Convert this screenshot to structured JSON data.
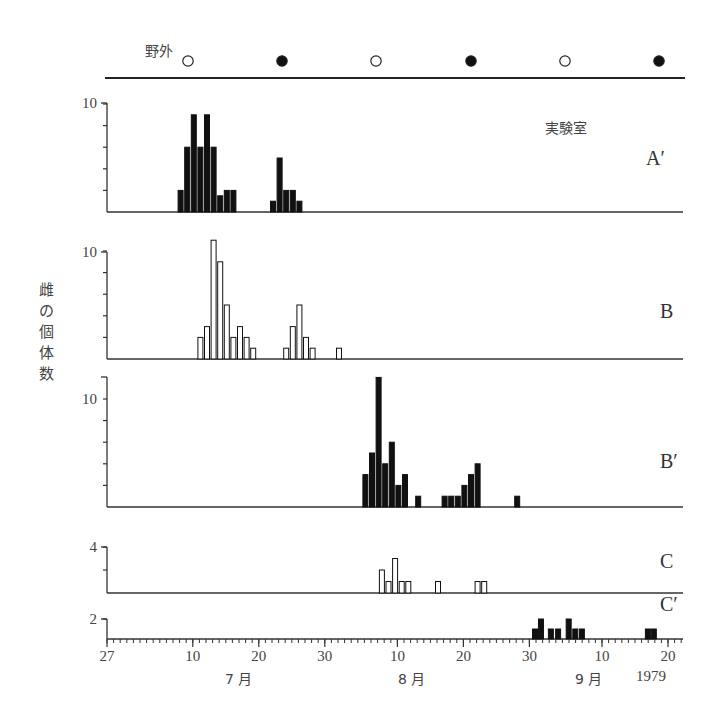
{
  "chart_data": [
    {
      "type": "bar",
      "panel": "A′",
      "fill": "#111111",
      "y_ticks": [
        2,
        4,
        6,
        8,
        10
      ],
      "y_label_shown": "10",
      "ylim": [
        0,
        10
      ],
      "bars": [
        {
          "day": 11,
          "value": 2
        },
        {
          "day": 12,
          "value": 6
        },
        {
          "day": 13,
          "value": 9
        },
        {
          "day": 14,
          "value": 6
        },
        {
          "day": 15,
          "value": 9
        },
        {
          "day": 16,
          "value": 6
        },
        {
          "day": 17,
          "value": 1.5
        },
        {
          "day": 18,
          "value": 2
        },
        {
          "day": 19,
          "value": 2
        },
        {
          "day": 25,
          "value": 1
        },
        {
          "day": 26,
          "value": 5
        },
        {
          "day": 27,
          "value": 2
        },
        {
          "day": 28,
          "value": 2
        },
        {
          "day": 29,
          "value": 1
        }
      ]
    },
    {
      "type": "bar",
      "panel": "B",
      "fill": "#ffffff",
      "y_ticks": [
        2,
        4,
        6,
        8,
        10
      ],
      "y_label_shown": "10",
      "ylim": [
        0,
        10
      ],
      "bars": [
        {
          "day": 14,
          "value": 2
        },
        {
          "day": 15,
          "value": 3
        },
        {
          "day": 16,
          "value": 11
        },
        {
          "day": 17,
          "value": 9
        },
        {
          "day": 18,
          "value": 5
        },
        {
          "day": 19,
          "value": 2
        },
        {
          "day": 20,
          "value": 3
        },
        {
          "day": 21,
          "value": 2
        },
        {
          "day": 22,
          "value": 1
        },
        {
          "day": 27,
          "value": 1
        },
        {
          "day": 28,
          "value": 3
        },
        {
          "day": 29,
          "value": 5
        },
        {
          "day": 30,
          "value": 2
        },
        {
          "day": 31,
          "value": 1
        },
        {
          "day": 35,
          "value": 1
        }
      ]
    },
    {
      "type": "bar",
      "panel": "B′",
      "fill": "#111111",
      "y_ticks": [
        2,
        4,
        6,
        8,
        10
      ],
      "y_label_shown": "10",
      "ylim": [
        0,
        12.5
      ],
      "bars": [
        {
          "day": 39,
          "value": 3
        },
        {
          "day": 40,
          "value": 5
        },
        {
          "day": 41,
          "value": 12
        },
        {
          "day": 42,
          "value": 4
        },
        {
          "day": 43,
          "value": 6
        },
        {
          "day": 44,
          "value": 2
        },
        {
          "day": 45,
          "value": 3
        },
        {
          "day": 47,
          "value": 1
        },
        {
          "day": 51,
          "value": 1
        },
        {
          "day": 52,
          "value": 1
        },
        {
          "day": 53,
          "value": 1
        },
        {
          "day": 54,
          "value": 2
        },
        {
          "day": 55,
          "value": 3
        },
        {
          "day": 56,
          "value": 4
        },
        {
          "day": 62,
          "value": 1
        }
      ]
    },
    {
      "type": "bar",
      "panel": "C",
      "fill": "#ffffff",
      "y_ticks": [
        2,
        4
      ],
      "y_label_shown": "4",
      "ylim": [
        0,
        4
      ],
      "bars": [
        {
          "day": 41.5,
          "value": 2
        },
        {
          "day": 42.5,
          "value": 1
        },
        {
          "day": 43.5,
          "value": 3
        },
        {
          "day": 44.5,
          "value": 1
        },
        {
          "day": 45.5,
          "value": 1
        },
        {
          "day": 50,
          "value": 1
        },
        {
          "day": 56,
          "value": 1
        },
        {
          "day": 57,
          "value": 1
        }
      ]
    },
    {
      "type": "bar",
      "panel": "C′",
      "fill": "#111111",
      "y_ticks": [
        2
      ],
      "y_label_shown": "2",
      "ylim": [
        0,
        2
      ],
      "bars": [
        {
          "day": 64.7,
          "value": 1
        },
        {
          "day": 65.6,
          "value": 2
        },
        {
          "day": 67.1,
          "value": 1
        },
        {
          "day": 68.2,
          "value": 1
        },
        {
          "day": 69.8,
          "value": 2
        },
        {
          "day": 70.8,
          "value": 1
        },
        {
          "day": 71.8,
          "value": 1
        },
        {
          "day": 81.8,
          "value": 1
        },
        {
          "day": 82.7,
          "value": 1
        }
      ]
    }
  ],
  "labels": {
    "field": "野外",
    "lab": "実験室",
    "ylabel": "雌の個体数",
    "ylabel_chars": [
      "雌",
      "の",
      "個",
      "体",
      "数"
    ],
    "panels": [
      "A′",
      "B",
      "B′",
      "C",
      "C′"
    ],
    "x_ticks": [
      {
        "text": "27",
        "day": 0
      },
      {
        "text": "10",
        "day": 13
      },
      {
        "text": "20",
        "day": 23
      },
      {
        "text": "30",
        "day": 33
      },
      {
        "text": "10",
        "day": 44
      },
      {
        "text": "20",
        "day": 54
      },
      {
        "text": "30",
        "day": 64
      },
      {
        "text": "10",
        "day": 75
      },
      {
        "text": "20",
        "day": 85
      }
    ],
    "months": [
      {
        "text": "7 月",
        "x": 238
      },
      {
        "text": "8 月",
        "x": 410
      },
      {
        "text": "9 月",
        "x": 588
      }
    ],
    "year": "1979"
  },
  "moon_phases": [
    {
      "phase": "full",
      "symbol": "open-circle",
      "x": 188
    },
    {
      "phase": "new",
      "symbol": "filled-circle",
      "x": 282
    },
    {
      "phase": "full",
      "symbol": "open-circle",
      "x": 376
    },
    {
      "phase": "new",
      "symbol": "filled-circle",
      "x": 471
    },
    {
      "phase": "full",
      "symbol": "open-circle",
      "x": 565
    },
    {
      "phase": "new",
      "symbol": "filled-circle",
      "x": 659
    }
  ]
}
